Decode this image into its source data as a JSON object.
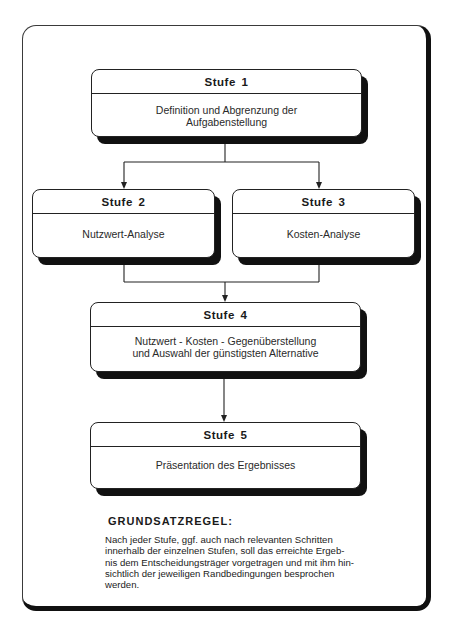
{
  "diagram": {
    "stages": [
      {
        "id": 1,
        "title": "Stufe 1",
        "text": "Definition und Abgrenzung der\nAufgabenstellung"
      },
      {
        "id": 2,
        "title": "Stufe 2",
        "text": "Nutzwert-Analyse"
      },
      {
        "id": 3,
        "title": "Stufe 3",
        "text": "Kosten-Analyse"
      },
      {
        "id": 4,
        "title": "Stufe 4",
        "text": "Nutzwert - Kosten - Gegenüberstellung\nund Auswahl der günstigsten Alternative"
      },
      {
        "id": 5,
        "title": "Stufe 5",
        "text": "Präsentation des Ergebnisses"
      }
    ],
    "edges": [
      {
        "from": 1,
        "to": 2
      },
      {
        "from": 1,
        "to": 3
      },
      {
        "from": 2,
        "to": 4
      },
      {
        "from": 3,
        "to": 4
      },
      {
        "from": 4,
        "to": 5
      }
    ],
    "rule": {
      "heading": "GRUNDSATZREGEL:",
      "text": "Nach jeder Stufe, ggf. auch nach relevanten Schritten\ninnerhalb der einzelnen Stufen, soll das erreichte Ergeb-\nnis dem Entscheidungsträger vorgetragen und mit ihm hin-\nsichtlich der jeweiligen Randbedingungen besprochen\nwerden."
    }
  },
  "colors": {
    "line": "#222222",
    "shadow": "#111111",
    "background": "#ffffff"
  }
}
